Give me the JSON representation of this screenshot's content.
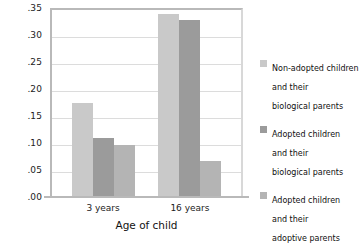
{
  "chart_data": {
    "type": "bar",
    "title": "",
    "subtitle": "",
    "xlabel": "Age of child",
    "ylabel": "",
    "categories": [
      "3 years",
      "16 years"
    ],
    "series": [
      {
        "name": "Non-adopted children and their biological parents",
        "legend_lines": "Non-adopted children\nand their\nbiological parents",
        "color": "#c9c9c9",
        "values": [
          0.175,
          0.338
        ]
      },
      {
        "name": "Adopted children and their biological parents",
        "legend_lines": "Adopted children\nand their\nbiological parents",
        "color": "#9b9b9b",
        "values": [
          0.11,
          0.328
        ]
      },
      {
        "name": "Adopted children and their adoptive parents",
        "legend_lines": "Adopted children\nand  their\nadoptive parents",
        "color": "#b4b4b4",
        "values": [
          0.097,
          0.067
        ]
      }
    ],
    "ylim": [
      0.0,
      0.35
    ],
    "ytick_labels": [
      ".00",
      ".05",
      ".10",
      ".15",
      ".20",
      ".25",
      ".30",
      ".35"
    ],
    "ytick_values": [
      0.0,
      0.05,
      0.1,
      0.15,
      0.2,
      0.25,
      0.3,
      0.35
    ],
    "grid": true,
    "legend_position": "right"
  }
}
